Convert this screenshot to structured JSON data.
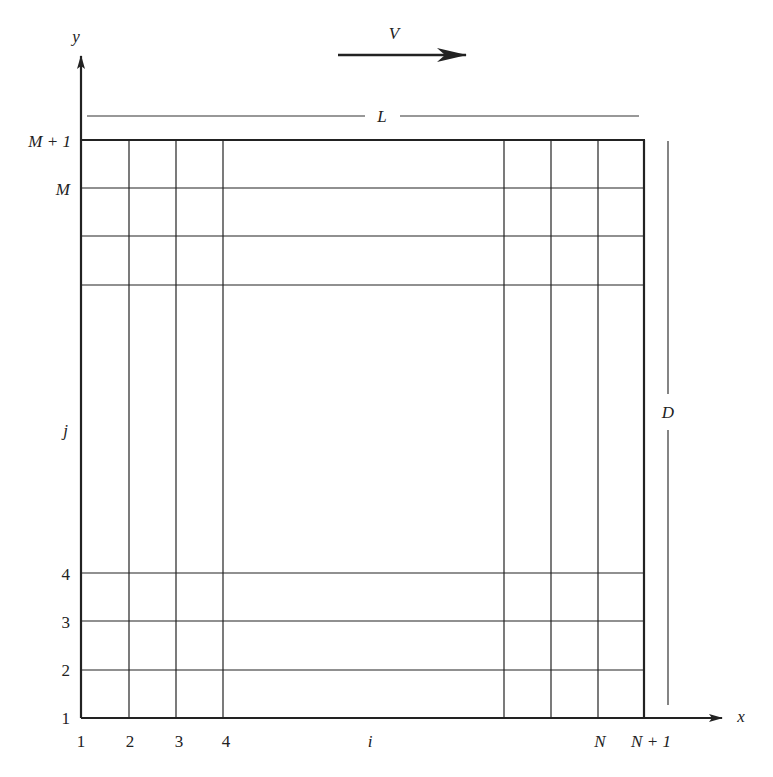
{
  "diagram": {
    "type": "computational-grid",
    "colors": {
      "line": "#222222",
      "background": "#ffffff"
    },
    "axes": {
      "x_label": "x",
      "y_label": "y"
    },
    "velocity": {
      "label": "V",
      "direction": "right"
    },
    "dimensions": {
      "length_label": "L",
      "height_label": "D"
    },
    "x_ticks": [
      {
        "label": "1",
        "italic": false
      },
      {
        "label": "2",
        "italic": false
      },
      {
        "label": "3",
        "italic": false
      },
      {
        "label": "4",
        "italic": false
      },
      {
        "label": "i",
        "italic": true
      },
      {
        "label": "N",
        "italic": true
      },
      {
        "label": "N + 1",
        "italic": true
      }
    ],
    "y_ticks": [
      {
        "label": "1",
        "italic": false
      },
      {
        "label": "2",
        "italic": false
      },
      {
        "label": "3",
        "italic": false
      },
      {
        "label": "4",
        "italic": false
      },
      {
        "label": "j",
        "italic": true
      },
      {
        "label": "M",
        "italic": true
      },
      {
        "label": "M + 1",
        "italic": true
      }
    ]
  }
}
